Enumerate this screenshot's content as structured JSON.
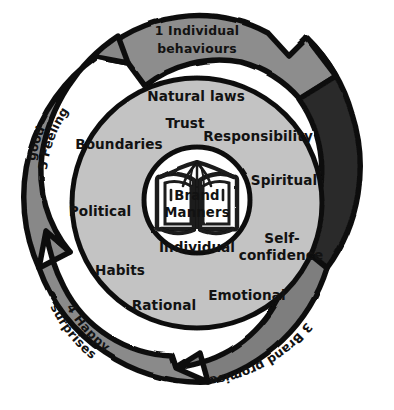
{
  "diagram": {
    "title": "Brand Manners",
    "type": "concentric-cycle",
    "colors": {
      "background": "#ffffff",
      "outline": "#111111",
      "segment_light": "#8d8d8d",
      "segment_mid": "#7b7b7b",
      "segment_dark": "#2a2a2a",
      "inner_disc": "#c3c3c3",
      "core": "#ffffff",
      "text_dark": "#121212",
      "text_light": "#ffffff"
    },
    "core": {
      "icon": "open-book-icon",
      "line1": "Brand",
      "line2": "Manners",
      "below_label": "Individual"
    },
    "outer_ring": {
      "name": "brand-manners-cycle",
      "segments": [
        {
          "number": "1",
          "label": "1  Individual",
          "label_line2": "behaviours",
          "full_label": "1 Individual behaviours",
          "tone": "light",
          "text_color": "dark"
        },
        {
          "number": "2",
          "label": "2 Encounters",
          "full_label": "2 Encounters",
          "tone": "dark",
          "text_color": "light"
        },
        {
          "number": "3",
          "label": "3 Brand promise",
          "full_label": "3 Brand promise",
          "tone": "light",
          "text_color": "dark"
        },
        {
          "number": "4",
          "label": "4 Happy",
          "label_line2": "surprises",
          "full_label": "4 Happy surprises",
          "tone": "light",
          "text_color": "dark"
        },
        {
          "number": "5",
          "label": "5 Feeling",
          "label_line2": "good",
          "full_label": "5 Feeling good",
          "tone": "light",
          "text_color": "dark"
        }
      ]
    },
    "inner_ring": {
      "name": "brand-manners-attributes",
      "items": [
        {
          "label": "Natural laws"
        },
        {
          "label": "Trust"
        },
        {
          "label": "Responsibility"
        },
        {
          "label": "Spiritual"
        },
        {
          "label": "Self-"
        },
        {
          "label": "confidence"
        },
        {
          "label": "Emotional"
        },
        {
          "label": "Rational"
        },
        {
          "label": "Habits"
        },
        {
          "label": "Political"
        },
        {
          "label": "Boundaries"
        }
      ]
    }
  }
}
